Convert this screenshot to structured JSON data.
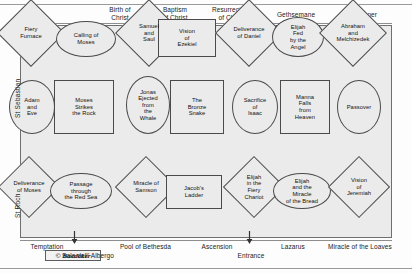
{
  "diagram": {
    "title_top_labels": [
      {
        "text": "Birth of\nChrist",
        "x": 90,
        "y": 6,
        "w": 60
      },
      {
        "text": "Baptism\nof Christ",
        "x": 145,
        "y": 6,
        "w": 60
      },
      {
        "text": "Resurrection\nof Christ",
        "x": 196,
        "y": 6,
        "w": 70
      },
      {
        "text": "Gethsemane",
        "x": 265,
        "y": 11,
        "w": 62
      },
      {
        "text": "Last Supper",
        "x": 330,
        "y": 11,
        "w": 58
      }
    ],
    "bottom_labels": [
      {
        "text": "Temptation",
        "x": 18,
        "y": 243,
        "w": 58
      },
      {
        "text": "Sala dell' Albergo",
        "x": 48,
        "y": 252,
        "w": 80
      },
      {
        "text": "Pool of Bethesda",
        "x": 108,
        "y": 243,
        "w": 75
      },
      {
        "text": "Ascension",
        "x": 188,
        "y": 243,
        "w": 58
      },
      {
        "text": "Entrance",
        "x": 224,
        "y": 252,
        "w": 54
      },
      {
        "text": "Lazarus",
        "x": 268,
        "y": 243,
        "w": 50
      },
      {
        "text": "Miracle of the Loaves",
        "x": 312,
        "y": 243,
        "w": 96
      }
    ],
    "side_labels": [
      {
        "text": "St Sebastian"
      },
      {
        "text": "St Roch"
      }
    ],
    "copyright": "© Baedeker",
    "rows": [
      {
        "name": "upper-row",
        "scenes": [
          {
            "label": "Fiery\nFurnace",
            "shape": "diamond",
            "x": 30,
            "y": 32,
            "w": 48,
            "h": 48
          },
          {
            "label": "Calling of\nMoses",
            "shape": "ellipse",
            "x": 85,
            "y": 38,
            "w": 60,
            "h": 36
          },
          {
            "label": "Samuel\nand\nSaul",
            "shape": "diamond",
            "x": 148,
            "y": 32,
            "w": 48,
            "h": 48
          },
          {
            "label": "Vision\nof\nEzekiel",
            "shape": "rectangle",
            "x": 186,
            "y": 37,
            "w": 58,
            "h": 38
          },
          {
            "label": "Deliverance\nof Daniel",
            "shape": "diamond",
            "x": 248,
            "y": 32,
            "w": 48,
            "h": 48
          },
          {
            "label": "Elijah\nFed\nby the\nAngel",
            "shape": "ellipse",
            "x": 297,
            "y": 36,
            "w": 52,
            "h": 40
          },
          {
            "label": "Abraham\nand\nMelchizedek",
            "shape": "diamond",
            "x": 352,
            "y": 32,
            "w": 48,
            "h": 48
          }
        ]
      },
      {
        "name": "middle-row",
        "scenes": [
          {
            "label": "Adam\nand\nEve",
            "shape": "ellipse",
            "x": 31,
            "y": 106,
            "w": 46,
            "h": 54
          },
          {
            "label": "Moses\nStrikes\nthe Rock",
            "shape": "rectangle",
            "x": 83,
            "y": 106,
            "w": 60,
            "h": 54
          },
          {
            "label": "Jonas\nEjected\nfrom\nthe\nWhale",
            "shape": "ellipse",
            "x": 147,
            "y": 104,
            "w": 44,
            "h": 58
          },
          {
            "label": "The\nBronze\nSnake",
            "shape": "rectangle",
            "x": 196,
            "y": 106,
            "w": 54,
            "h": 54
          },
          {
            "label": "Sacrifice\nof\nIsaac",
            "shape": "ellipse",
            "x": 254,
            "y": 106,
            "w": 46,
            "h": 54
          },
          {
            "label": "Manna\nFalls\nfrom\nHeaven",
            "shape": "rectangle",
            "x": 304,
            "y": 106,
            "w": 50,
            "h": 54
          },
          {
            "label": "Passover",
            "shape": "ellipse",
            "x": 358,
            "y": 106,
            "w": 44,
            "h": 54
          }
        ]
      },
      {
        "name": "lower-row",
        "scenes": [
          {
            "label": "Deliverance\nof Moses",
            "shape": "diamond",
            "x": 28,
            "y": 186,
            "w": 44,
            "h": 44
          },
          {
            "label": "Passage\nthrough\nthe Red Sea",
            "shape": "ellipse",
            "x": 80,
            "y": 190,
            "w": 62,
            "h": 36
          },
          {
            "label": "Miracle of\nSamson",
            "shape": "diamond",
            "x": 145,
            "y": 186,
            "w": 44,
            "h": 44
          },
          {
            "label": "Jacob's\nLadder",
            "shape": "rectangle",
            "x": 193,
            "y": 191,
            "w": 56,
            "h": 34
          },
          {
            "label": "Elijah\nin the\nFiery\nChariot",
            "shape": "diamond",
            "x": 253,
            "y": 186,
            "w": 44,
            "h": 44
          },
          {
            "label": "Elijah\nand the\nMiracle\nof the Bread",
            "shape": "ellipse",
            "x": 301,
            "y": 190,
            "w": 58,
            "h": 36
          },
          {
            "label": "Vision\nof\nJeremiah",
            "shape": "diamond",
            "x": 358,
            "y": 186,
            "w": 44,
            "h": 44
          }
        ]
      }
    ],
    "markers": [
      {
        "name": "sala-albergo-arrow",
        "x": 70,
        "y": 231
      },
      {
        "name": "entrance-arrow",
        "x": 245,
        "y": 231
      }
    ]
  },
  "colors": {
    "panel_bg": "#ebebeb",
    "frame_line": "#6f6f6f",
    "shape_line": "#4a4a4a",
    "text": "#111111",
    "rule": "#9a9a9a"
  }
}
